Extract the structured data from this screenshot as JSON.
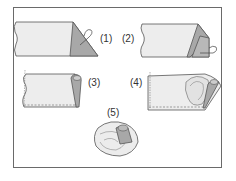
{
  "diagram": {
    "type": "illustration",
    "steps": [
      {
        "label": "(1)",
        "caption": "Fold corner of strip into a triangle"
      },
      {
        "label": "(2)",
        "caption": "Fold triangle over again"
      },
      {
        "label": "(3)",
        "caption": "Roll folded end into a tube, baste along bottom edge"
      },
      {
        "label": "(4)",
        "caption": "Gather and wrap strip around rolled center"
      },
      {
        "label": "(5)",
        "caption": "Finished rose"
      }
    ],
    "colors": {
      "fabric_light": "#ededed",
      "fabric_dark": "#a8a8a8",
      "outline": "#555555",
      "frame": "#6a6a6a"
    }
  }
}
